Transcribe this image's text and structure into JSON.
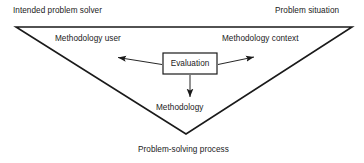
{
  "diagram": {
    "background_color": "#ffffff",
    "line_color": "#1a1a1a",
    "text_color": "#1a1a1a",
    "triangle": {
      "shape": "inverted-triangle",
      "stroke_width": 1.6,
      "points": [
        {
          "x": 16,
          "y": 27
        },
        {
          "x": 352,
          "y": 27
        },
        {
          "x": 186,
          "y": 134
        }
      ]
    },
    "corner_labels": {
      "top_left": "Intended problem solver",
      "top_right": "Problem situation",
      "bottom": "Problem-solving process"
    },
    "inner_labels": {
      "left": "Methodology user",
      "right": "Methodology context",
      "below_box": "Methodology"
    },
    "center_box": {
      "label": "Evaluation",
      "x": 163,
      "y": 53,
      "width": 54,
      "height": 21,
      "stroke_width": 1.2
    },
    "arrows": [
      {
        "name": "arrow-to-methodology-user",
        "direction": "upper-left",
        "from": {
          "x": 163,
          "y": 64
        },
        "to": {
          "x": 114,
          "y": 57
        }
      },
      {
        "name": "arrow-to-methodology-context",
        "direction": "upper-right",
        "from": {
          "x": 217,
          "y": 64
        },
        "to": {
          "x": 258,
          "y": 56
        }
      },
      {
        "name": "arrow-to-methodology",
        "direction": "down",
        "from": {
          "x": 190,
          "y": 74
        },
        "to": {
          "x": 190,
          "y": 101
        }
      }
    ]
  }
}
